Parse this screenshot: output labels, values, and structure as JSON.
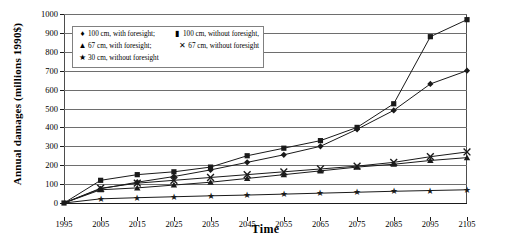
{
  "chart_data": {
    "type": "line",
    "title": "",
    "xlabel": "Time",
    "ylabel": "Annual damages (millions 1990$)",
    "x": [
      1995,
      2005,
      2015,
      2025,
      2035,
      2045,
      2055,
      2065,
      2075,
      2085,
      2095,
      2105
    ],
    "xlim": [
      1995,
      2105
    ],
    "ylim": [
      0,
      1000
    ],
    "yticks": [
      0,
      100,
      200,
      300,
      400,
      500,
      600,
      700,
      800,
      900,
      1000
    ],
    "xticks": [
      "1995",
      "2005",
      "2015",
      "2025",
      "2035",
      "2045",
      "2055",
      "2065",
      "2075",
      "2085",
      "2095",
      "2105"
    ],
    "grid": true,
    "legend_position": "upper-left-inside",
    "series": [
      {
        "name": "100 cm, with foresight",
        "marker": "diamond",
        "values": [
          0,
          75,
          110,
          140,
          175,
          215,
          255,
          300,
          390,
          490,
          630,
          700
        ]
      },
      {
        "name": "100 cm, without foresight",
        "marker": "square",
        "values": [
          0,
          120,
          150,
          165,
          190,
          250,
          290,
          330,
          400,
          525,
          880,
          970
        ]
      },
      {
        "name": "67 cm, with foresight",
        "marker": "triangle",
        "values": [
          0,
          70,
          80,
          95,
          110,
          130,
          150,
          170,
          190,
          205,
          225,
          240
        ]
      },
      {
        "name": "67 cm, without foresight",
        "marker": "cross",
        "values": [
          0,
          78,
          105,
          120,
          135,
          150,
          165,
          180,
          195,
          215,
          245,
          270
        ]
      },
      {
        "name": "30 cm, without foresight",
        "marker": "star",
        "values": [
          0,
          22,
          28,
          33,
          38,
          42,
          47,
          52,
          57,
          62,
          66,
          70
        ]
      }
    ]
  },
  "legend": {
    "rows": [
      [
        {
          "marker_glyph": "♦",
          "marker_name": "diamond-marker",
          "label": "100 cm, with foresight;"
        },
        {
          "marker_glyph": "▮",
          "marker_name": "square-marker",
          "label": "100 cm, without foresight,"
        }
      ],
      [
        {
          "marker_glyph": "▲",
          "marker_name": "triangle-marker",
          "label": "67 cm, with foresight;"
        },
        {
          "marker_glyph": "✕",
          "marker_name": "cross-marker",
          "label": "67 cm, without foresight"
        }
      ],
      [
        {
          "marker_glyph": "★",
          "marker_name": "star-marker",
          "label": "30 cm, without foresight"
        }
      ]
    ]
  },
  "axes": {
    "ylabel": "Annual damages (millions 1990$)",
    "xlabel": "Time"
  },
  "colors": {
    "line": "#1a1a1a",
    "grid": "#6e6e6e",
    "frame": "#4d4d4d",
    "background": "#ffffff"
  }
}
